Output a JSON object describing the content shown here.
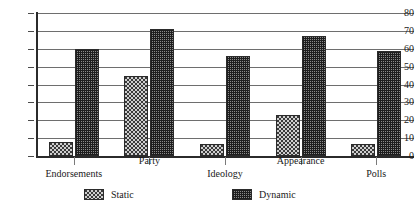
{
  "chart_data": {
    "type": "bar",
    "title": "",
    "subtitle": "",
    "xlabel": "",
    "ylabel": "",
    "ylim": [
      0,
      80
    ],
    "y_ticks": [
      0,
      10,
      20,
      30,
      40,
      50,
      60,
      70,
      80
    ],
    "grid": "horizontal",
    "legend_position": "bottom",
    "categories": [
      "Endorsements",
      "Party",
      "Ideology",
      "Appearance",
      "Polls"
    ],
    "series": [
      {
        "name": "Static",
        "values": [
          8,
          45,
          7,
          23,
          7
        ],
        "pattern": "sparse-checker",
        "color": "#cfcfcf"
      },
      {
        "name": "Dynamic",
        "values": [
          60,
          71,
          56,
          67,
          59
        ],
        "pattern": "dense-crosshatch",
        "color": "#8a8a8a"
      }
    ]
  },
  "axis": {
    "y_tick_labels": [
      "80",
      "70",
      "60",
      "50",
      "40",
      "30",
      "20",
      "10",
      "0"
    ]
  },
  "legend": {
    "items": [
      {
        "label": "Static"
      },
      {
        "label": "Dynamic"
      }
    ]
  }
}
